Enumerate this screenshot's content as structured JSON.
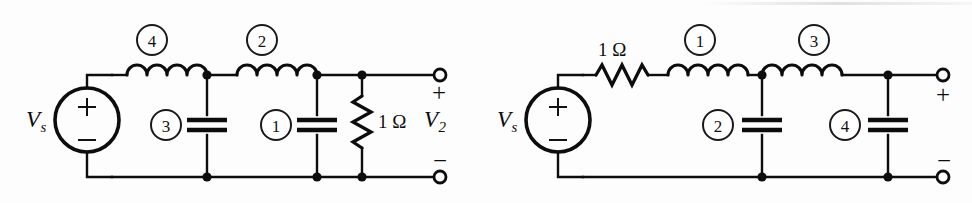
{
  "figure": {
    "type": "circuit-schematic-pair"
  },
  "circuits": [
    {
      "id": "left",
      "name": "left-circuit",
      "source": {
        "label_v": "V",
        "label_sub": "s",
        "plus": "+",
        "minus": "−"
      },
      "series_elements": [
        {
          "kind": "inductor",
          "number": "4"
        },
        {
          "kind": "inductor",
          "number": "2"
        }
      ],
      "shunt_elements": [
        {
          "kind": "capacitor",
          "number": "3"
        },
        {
          "kind": "capacitor",
          "number": "1"
        }
      ],
      "load": {
        "kind": "resistor",
        "value": "1",
        "unit": "Ω",
        "orientation": "vertical"
      },
      "output": {
        "label_v": "V",
        "label_sub": "2",
        "plus": "+",
        "minus": "−"
      }
    },
    {
      "id": "right",
      "name": "right-circuit",
      "source": {
        "label_v": "V",
        "label_sub": "s",
        "plus": "+",
        "minus": "−"
      },
      "source_resistor": {
        "kind": "resistor",
        "value": "1",
        "unit": "Ω",
        "orientation": "horizontal"
      },
      "series_elements": [
        {
          "kind": "inductor",
          "number": "1"
        },
        {
          "kind": "inductor",
          "number": "3"
        }
      ],
      "shunt_elements": [
        {
          "kind": "capacitor",
          "number": "2"
        },
        {
          "kind": "capacitor",
          "number": "4"
        }
      ],
      "output": {
        "plus": "+",
        "minus": "−"
      }
    }
  ],
  "colors": {
    "ink": "#0d0d0d",
    "paper": "#fdfdfd"
  }
}
